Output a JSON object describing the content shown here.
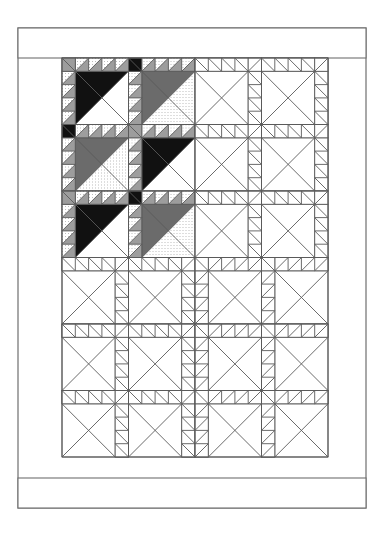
{
  "caption": {
    "text": "2013"
  },
  "canvas": {
    "width": 385,
    "height": 537
  },
  "frame": {
    "name": "outer-frame",
    "x": 18,
    "y": 28,
    "width": 348,
    "height": 480,
    "stroke": "#6f6f6f",
    "stroke_width": 1.2,
    "fill": "#ffffff"
  },
  "borders": [
    {
      "name": "top-border",
      "x": 18,
      "y": 28,
      "width": 348,
      "height": 30,
      "stroke": "#6f6f6f",
      "fill": "#ffffff"
    },
    {
      "name": "bottom-border",
      "x": 18,
      "y": 478,
      "width": 348,
      "height": 30,
      "stroke": "#6f6f6f",
      "fill": "#ffffff"
    }
  ],
  "palette": {
    "black": "#111111",
    "dark_gray": "#6b6b6b",
    "mid_gray": "#9d9d9d",
    "light_dot": "#e9e9e9",
    "white": "#ffffff",
    "line": "#5a5a5a",
    "frame_line": "#6f6f6f"
  },
  "grid": {
    "name": "block-grid",
    "origin_x": 62,
    "origin_y": 58,
    "block_size": 66.5,
    "columns": 4,
    "rows": 6,
    "sawtooth_units": 4,
    "label": "4 columns x 6 rows of pieced blocks"
  },
  "legend": {
    "swatches": [
      {
        "name": "fabric-black",
        "label": "black",
        "color": "#111111"
      },
      {
        "name": "fabric-dark-gray",
        "label": "dark gray",
        "color": "#6b6b6b"
      },
      {
        "name": "fabric-mid-gray",
        "label": "medium gray",
        "color": "#9d9d9d"
      },
      {
        "name": "fabric-light-dot",
        "label": "light dotted",
        "color": "#e9e9e9"
      },
      {
        "name": "fabric-white",
        "label": "white",
        "color": "#ffffff"
      }
    ]
  },
  "blocks": [
    {
      "row": 0,
      "col": 0,
      "flip": false,
      "big": "black",
      "bg": "white",
      "saw_tri": "mid_gray",
      "saw_bg": "light_dot",
      "corner": "mid_gray"
    },
    {
      "row": 0,
      "col": 1,
      "flip": false,
      "big": "dark_gray",
      "bg": "light_dot",
      "saw_tri": "mid_gray",
      "saw_bg": "light_dot",
      "corner": "black"
    },
    {
      "row": 0,
      "col": 2,
      "flip": true,
      "big": "white",
      "bg": "white",
      "saw_tri": "white",
      "saw_bg": "white",
      "corner": "white"
    },
    {
      "row": 0,
      "col": 3,
      "flip": true,
      "big": "white",
      "bg": "white",
      "saw_tri": "white",
      "saw_bg": "white",
      "corner": "white"
    },
    {
      "row": 1,
      "col": 0,
      "flip": false,
      "big": "dark_gray",
      "bg": "light_dot",
      "saw_tri": "mid_gray",
      "saw_bg": "light_dot",
      "corner": "black"
    },
    {
      "row": 1,
      "col": 1,
      "flip": false,
      "big": "black",
      "bg": "white",
      "saw_tri": "mid_gray",
      "saw_bg": "light_dot",
      "corner": "mid_gray"
    },
    {
      "row": 1,
      "col": 2,
      "flip": true,
      "big": "white",
      "bg": "white",
      "saw_tri": "white",
      "saw_bg": "white",
      "corner": "white"
    },
    {
      "row": 1,
      "col": 3,
      "flip": true,
      "big": "white",
      "bg": "white",
      "saw_tri": "white",
      "saw_bg": "white",
      "corner": "white"
    },
    {
      "row": 2,
      "col": 0,
      "flip": false,
      "big": "black",
      "bg": "white",
      "saw_tri": "mid_gray",
      "saw_bg": "light_dot",
      "corner": "mid_gray"
    },
    {
      "row": 2,
      "col": 1,
      "flip": false,
      "big": "dark_gray",
      "bg": "light_dot",
      "saw_tri": "mid_gray",
      "saw_bg": "light_dot",
      "corner": "black"
    },
    {
      "row": 2,
      "col": 2,
      "flip": true,
      "big": "white",
      "bg": "white",
      "saw_tri": "white",
      "saw_bg": "white",
      "corner": "white"
    },
    {
      "row": 2,
      "col": 3,
      "flip": true,
      "big": "white",
      "bg": "white",
      "saw_tri": "white",
      "saw_bg": "white",
      "corner": "white"
    },
    {
      "row": 3,
      "col": 0,
      "flip": true,
      "big": "white",
      "bg": "white",
      "saw_tri": "white",
      "saw_bg": "white",
      "corner": "white"
    },
    {
      "row": 3,
      "col": 1,
      "flip": true,
      "big": "white",
      "bg": "white",
      "saw_tri": "white",
      "saw_bg": "white",
      "corner": "white"
    },
    {
      "row": 3,
      "col": 2,
      "flip": false,
      "big": "white",
      "bg": "white",
      "saw_tri": "white",
      "saw_bg": "white",
      "corner": "white"
    },
    {
      "row": 3,
      "col": 3,
      "flip": false,
      "big": "white",
      "bg": "white",
      "saw_tri": "white",
      "saw_bg": "white",
      "corner": "white"
    },
    {
      "row": 4,
      "col": 0,
      "flip": true,
      "big": "white",
      "bg": "white",
      "saw_tri": "white",
      "saw_bg": "white",
      "corner": "white"
    },
    {
      "row": 4,
      "col": 1,
      "flip": true,
      "big": "white",
      "bg": "white",
      "saw_tri": "white",
      "saw_bg": "white",
      "corner": "white"
    },
    {
      "row": 4,
      "col": 2,
      "flip": false,
      "big": "white",
      "bg": "white",
      "saw_tri": "white",
      "saw_bg": "white",
      "corner": "white"
    },
    {
      "row": 4,
      "col": 3,
      "flip": false,
      "big": "white",
      "bg": "white",
      "saw_tri": "white",
      "saw_bg": "white",
      "corner": "white"
    },
    {
      "row": 5,
      "col": 0,
      "flip": true,
      "big": "white",
      "bg": "white",
      "saw_tri": "white",
      "saw_bg": "white",
      "corner": "white"
    },
    {
      "row": 5,
      "col": 1,
      "flip": true,
      "big": "white",
      "bg": "white",
      "saw_tri": "white",
      "saw_bg": "white",
      "corner": "white"
    },
    {
      "row": 5,
      "col": 2,
      "flip": false,
      "big": "white",
      "bg": "white",
      "saw_tri": "white",
      "saw_bg": "white",
      "corner": "white"
    },
    {
      "row": 5,
      "col": 3,
      "flip": false,
      "big": "white",
      "bg": "white",
      "saw_tri": "white",
      "saw_bg": "white",
      "corner": "white"
    }
  ]
}
